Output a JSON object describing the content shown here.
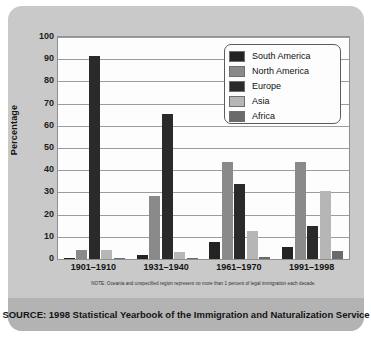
{
  "chart_data": {
    "type": "bar",
    "title": "",
    "xlabel": "",
    "ylabel": "Percentage",
    "ylim": [
      0,
      100
    ],
    "yticks": [
      100,
      90,
      80,
      70,
      60,
      50,
      40,
      30,
      20,
      10,
      0
    ],
    "grid": true,
    "legend_position": "top-right",
    "categories": [
      "1901–1910",
      "1931–1940",
      "1961–1970",
      "1991–1998"
    ],
    "series": [
      {
        "name": "South America",
        "color": "#232323",
        "values": [
          0.3,
          1.6,
          7.7,
          5.6
        ]
      },
      {
        "name": "North America",
        "color": "#8a8a8a",
        "values": [
          4.1,
          28.6,
          43.8,
          43.6
        ]
      },
      {
        "name": "Europe",
        "color": "#2a2a2a",
        "values": [
          91.5,
          65.5,
          33.8,
          14.8
        ]
      },
      {
        "name": "Asia",
        "color": "#b6b6b6",
        "values": [
          3.9,
          3.1,
          12.7,
          30.5
        ]
      },
      {
        "name": "Africa",
        "color": "#6a6a6a",
        "values": [
          0.3,
          0.3,
          0.9,
          3.6
        ]
      }
    ],
    "note": "NOTE: Oceania and unspecified region represent no more than 1 percent of legal immigration each decade.",
    "source": "SOURCE: 1998 Statistical Yearbook of the Immigration and Naturalization Service"
  },
  "colors": {
    "panel": "#c9c9c9",
    "source_bar": "#b3b3b3",
    "plot_background": "#fdfdfd",
    "axis": "#8f8f8f",
    "gridline": "#9d9d9d"
  }
}
